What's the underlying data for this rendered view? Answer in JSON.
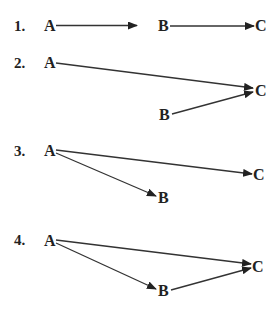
{
  "colors": {
    "ink": "#222222",
    "background": "#ffffff"
  },
  "diagrams": [
    {
      "number": "1.",
      "nodes": {
        "A": "A",
        "B": "B",
        "C": "C"
      },
      "edges": [
        {
          "from": "A",
          "to": "B"
        },
        {
          "from": "B",
          "to": "C"
        }
      ]
    },
    {
      "number": "2.",
      "nodes": {
        "A": "A",
        "B": "B",
        "C": "C"
      },
      "edges": [
        {
          "from": "A",
          "to": "C"
        },
        {
          "from": "B",
          "to": "C"
        }
      ]
    },
    {
      "number": "3.",
      "nodes": {
        "A": "A",
        "B": "B",
        "C": "C"
      },
      "edges": [
        {
          "from": "A",
          "to": "C"
        },
        {
          "from": "A",
          "to": "B"
        }
      ]
    },
    {
      "number": "4.",
      "nodes": {
        "A": "A",
        "B": "B",
        "C": "C"
      },
      "edges": [
        {
          "from": "A",
          "to": "C"
        },
        {
          "from": "A",
          "to": "B"
        },
        {
          "from": "B",
          "to": "C"
        }
      ]
    }
  ]
}
